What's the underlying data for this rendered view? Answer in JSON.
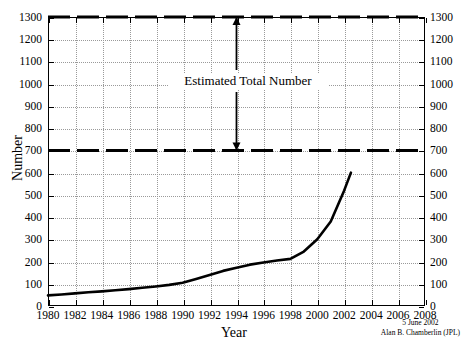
{
  "chart_data": {
    "type": "line",
    "title": "",
    "xlabel": "Year",
    "ylabel": "Number",
    "xlim": [
      1980,
      2008
    ],
    "ylim": [
      0,
      1300
    ],
    "grid": true,
    "legend": null,
    "xticks": [
      1980,
      1982,
      1984,
      1986,
      1988,
      1990,
      1992,
      1994,
      1996,
      1998,
      2000,
      2002,
      2004,
      2006,
      2008
    ],
    "xtick_labels": [
      "1980",
      "1982",
      "1984",
      "1986",
      "1988",
      "1990",
      "1992",
      "1994",
      "1996",
      "1998",
      "2000",
      "2002",
      "2004",
      "2006",
      "2008"
    ],
    "yticks": [
      0,
      100,
      200,
      300,
      400,
      500,
      600,
      700,
      800,
      900,
      1000,
      1100,
      1200,
      1300
    ],
    "ytick_labels": [
      "0",
      "100",
      "200",
      "300",
      "400",
      "500",
      "600",
      "700",
      "800",
      "900",
      "1000",
      "1100",
      "1200",
      "1300"
    ],
    "ytick_labels_right": [
      "0",
      "100",
      "200",
      "300",
      "400",
      "500",
      "600",
      "700",
      "800",
      "900",
      "1000",
      "1100",
      "1200",
      "1300"
    ],
    "series": [
      {
        "name": "Cumulative known number",
        "style": "solid",
        "color": "#000000",
        "x": [
          1980,
          1981,
          1982,
          1983,
          1984,
          1985,
          1986,
          1987,
          1988,
          1989,
          1990,
          1991,
          1992,
          1993,
          1994,
          1995,
          1996,
          1997,
          1998,
          1999,
          2000,
          2001,
          2002,
          2002.5
        ],
        "y": [
          48,
          52,
          57,
          62,
          66,
          71,
          76,
          82,
          88,
          95,
          105,
          122,
          140,
          158,
          172,
          186,
          196,
          205,
          212,
          245,
          300,
          380,
          520,
          600
        ]
      }
    ],
    "reference_lines": [
      {
        "name": "estimated-total-upper",
        "value": 1300,
        "style": "dashed",
        "color": "#000000"
      },
      {
        "name": "estimated-total-lower",
        "value": 700,
        "style": "dashed",
        "color": "#000000"
      }
    ],
    "annotations": [
      {
        "name": "estimated-total-number",
        "text": "Estimated Total Number",
        "arrow": "double-headed-vertical",
        "from_value": 700,
        "to_value": 1300,
        "at_x": 1994
      }
    ],
    "credit": {
      "date": "5 June 2002",
      "author": "Alan B. Chamberlin (JPL)"
    }
  },
  "colors": {
    "background": "#ffffff",
    "axis": "#000000",
    "grid": "#9a9a9a",
    "curve": "#000000"
  }
}
